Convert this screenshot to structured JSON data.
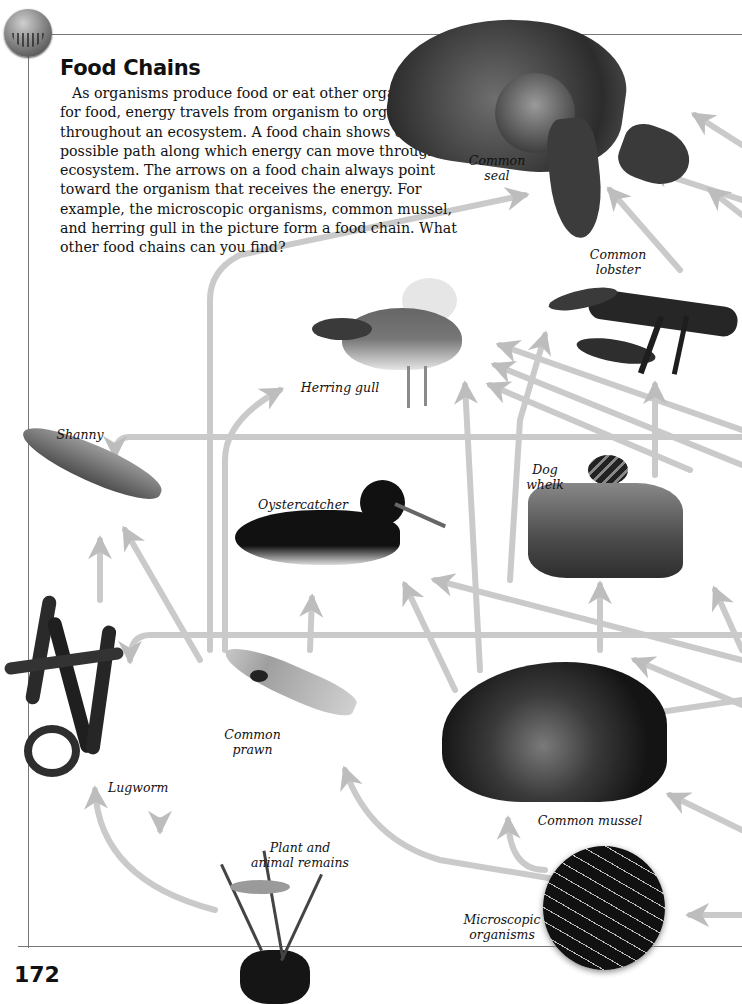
{
  "page": {
    "title": "Food Chains",
    "body": "As organisms produce food or eat other organisms for food, energy travels from organism to organism throughout an ecosystem. A food chain shows one possible path along which energy can move through an ecosystem. The arrows on a food chain always point toward the organism that receives the energy. For example, the microscopic organisms, common mussel, and herring gull in the picture form a food chain. What other food chains can you find?",
    "page_number": "172",
    "corner_icon": "sea-grass-badge-icon"
  },
  "organisms": [
    {
      "id": "common-seal",
      "label_line1": "Common",
      "label_line2": "seal"
    },
    {
      "id": "common-lobster",
      "label_line1": "Common",
      "label_line2": "lobster"
    },
    {
      "id": "herring-gull",
      "label_line1": "Herring gull",
      "label_line2": ""
    },
    {
      "id": "shanny",
      "label_line1": "Shanny",
      "label_line2": ""
    },
    {
      "id": "oystercatcher",
      "label_line1": "Oystercatcher",
      "label_line2": ""
    },
    {
      "id": "dog-whelk",
      "label_line1": "Dog",
      "label_line2": "whelk"
    },
    {
      "id": "lugworm",
      "label_line1": "Lugworm",
      "label_line2": ""
    },
    {
      "id": "common-prawn",
      "label_line1": "Common",
      "label_line2": "prawn"
    },
    {
      "id": "common-mussel",
      "label_line1": "Common mussel",
      "label_line2": ""
    },
    {
      "id": "plant-animal-remains",
      "label_line1": "Plant and",
      "label_line2": "animal remains"
    },
    {
      "id": "microscopic-organisms",
      "label_line1": "Microscopic",
      "label_line2": "organisms"
    }
  ],
  "colors": {
    "arrow": "#c9c9c9",
    "arrow_edge": "#a8a8a8",
    "frame": "#777777"
  }
}
